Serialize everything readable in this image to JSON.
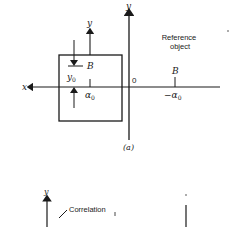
{
  "figure": {
    "panel_a": {
      "caption": "(a)",
      "axis_y_label": "y",
      "axis_x_label": "x",
      "origin_label": "0",
      "inner_axis_y_label": "y",
      "point_label_left": "B",
      "offset_label": "y",
      "offset_subscript": "0",
      "alpha_left": "α",
      "alpha_left_sub": "0",
      "reference_label_line1": "Reference",
      "reference_label_line2": "object",
      "point_label_right": "B",
      "alpha_right": "−α",
      "alpha_right_sub": "0"
    },
    "panel_b": {
      "axis_y_label": "y",
      "correlation_label": "Correlation"
    }
  },
  "colors": {
    "ink": "#1a1a1a",
    "background": "#ffffff"
  }
}
